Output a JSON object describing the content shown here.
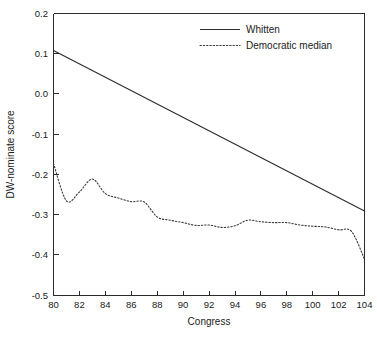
{
  "chart_data": {
    "type": "line",
    "title": "",
    "xlabel": "Congress",
    "ylabel": "DW-nominate score",
    "xlim": [
      80,
      104
    ],
    "ylim": [
      -0.5,
      0.2
    ],
    "grid": false,
    "legend_position": "top-right",
    "x_ticks": [
      "80",
      "82",
      "84",
      "86",
      "88",
      "90",
      "92",
      "94",
      "96",
      "98",
      "100",
      "102",
      "104"
    ],
    "x_tick_values": [
      80,
      82,
      84,
      86,
      88,
      90,
      92,
      94,
      96,
      98,
      100,
      102,
      104
    ],
    "y_ticks": [
      "0.2",
      "0.1",
      "0.0",
      "-0.1",
      "-0.2",
      "-0.3",
      "-0.4",
      "-0.5"
    ],
    "y_tick_values": [
      0.2,
      0.1,
      0.0,
      -0.1,
      -0.2,
      -0.3,
      -0.4,
      -0.5
    ],
    "x": [
      80,
      81,
      82,
      83,
      84,
      85,
      86,
      87,
      88,
      89,
      90,
      91,
      92,
      93,
      94,
      95,
      96,
      97,
      98,
      99,
      100,
      101,
      102,
      103,
      104
    ],
    "series": [
      {
        "name": "Whitten",
        "style": "solid",
        "color": "#2b2b2b",
        "x": [
          80,
          104
        ],
        "values": [
          0.108,
          -0.29
        ]
      },
      {
        "name": "Democratic median",
        "style": "dotted",
        "color": "#3a3a3a",
        "values": [
          -0.172,
          -0.265,
          -0.243,
          -0.211,
          -0.247,
          -0.258,
          -0.267,
          -0.268,
          -0.305,
          -0.313,
          -0.319,
          -0.326,
          -0.325,
          -0.331,
          -0.327,
          -0.313,
          -0.317,
          -0.319,
          -0.319,
          -0.325,
          -0.328,
          -0.33,
          -0.337,
          -0.341,
          -0.41
        ]
      }
    ]
  },
  "legend": {
    "entries": [
      {
        "label": "Whitten",
        "style": "solid"
      },
      {
        "label": "Democratic median",
        "style": "dotted"
      }
    ]
  },
  "axes": {
    "x_title": "Congress",
    "y_title": "DW-nominate score"
  }
}
